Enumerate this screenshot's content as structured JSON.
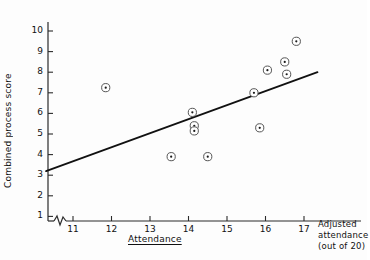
{
  "chart_data": {
    "type": "scatter",
    "title": "",
    "xlabel": "Attendance",
    "ylabel": "Combined process score",
    "xlabel_right": "Adjusted attendance (out of 20)",
    "xlim": [
      10.3,
      17.6
    ],
    "ylim": [
      0,
      10.6
    ],
    "grid": false,
    "legend": null,
    "axis_break": {
      "x": true,
      "y": false,
      "note": "zigzag break near origin on x-axis"
    },
    "x_ticks": [
      11,
      12,
      13,
      14,
      15,
      16,
      17
    ],
    "y_ticks": [
      1,
      2,
      3,
      4,
      5,
      6,
      7,
      8,
      9,
      10
    ],
    "marker": "circle-with-center-dot",
    "points": [
      {
        "x": 11.85,
        "y": 7.25
      },
      {
        "x": 13.55,
        "y": 3.9
      },
      {
        "x": 14.1,
        "y": 6.05
      },
      {
        "x": 14.15,
        "y": 5.4
      },
      {
        "x": 14.15,
        "y": 5.15
      },
      {
        "x": 14.5,
        "y": 3.9
      },
      {
        "x": 15.7,
        "y": 7.0
      },
      {
        "x": 15.85,
        "y": 5.3
      },
      {
        "x": 16.05,
        "y": 8.1
      },
      {
        "x": 16.5,
        "y": 8.5
      },
      {
        "x": 16.55,
        "y": 7.9
      },
      {
        "x": 16.8,
        "y": 9.5
      }
    ],
    "trend_line": {
      "type": "linear-fit",
      "x_start": 10.3,
      "y_start": 3.2,
      "x_end": 17.35,
      "y_end": 8.0
    }
  },
  "axes": {
    "y_title": "Combined process score",
    "x_title": "Attendance",
    "x_title_right_line1": "Adjusted",
    "x_title_right_line2": "attendance",
    "x_title_right_line3": "(out of 20)"
  },
  "tick_labels": {
    "y": [
      "10",
      "9",
      "8",
      "7",
      "6",
      "5",
      "4",
      "3",
      "2",
      "1"
    ],
    "x": [
      "11",
      "12",
      "13",
      "14",
      "15",
      "16",
      "17"
    ]
  },
  "colors": {
    "ink": "#1a1a1a",
    "axis": "#2b2b2b",
    "marker_stroke": "#555555",
    "trend": "#111111",
    "background": "#fdfdfd"
  }
}
